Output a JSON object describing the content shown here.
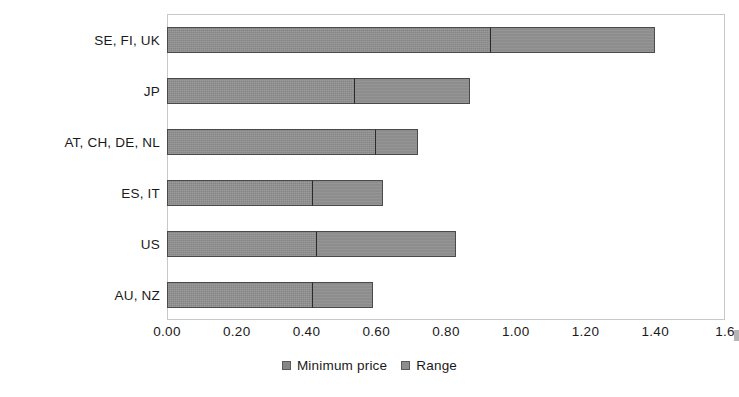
{
  "chart_data": {
    "type": "bar",
    "orientation": "horizontal",
    "stacked": true,
    "title": "",
    "subtitle": "",
    "xlabel": "",
    "ylabel": "",
    "categories": [
      "SE, FI, UK",
      "JP",
      "AT, CH, DE, NL",
      "ES, IT",
      "US",
      "AU, NZ"
    ],
    "series": [
      {
        "name": "Minimum price",
        "color": "#868686",
        "values": [
          0.93,
          0.54,
          0.6,
          0.42,
          0.43,
          0.42
        ]
      },
      {
        "name": "Range",
        "color": "#8d8d8d",
        "values": [
          0.47,
          0.33,
          0.12,
          0.2,
          0.4,
          0.17
        ]
      }
    ],
    "totals": [
      1.4,
      0.87,
      0.72,
      0.62,
      0.83,
      0.59
    ],
    "xlim": [
      0.0,
      1.6
    ],
    "xticks": [
      0.0,
      0.2,
      0.4,
      0.6,
      0.8,
      1.0,
      1.2,
      1.4,
      1.6
    ],
    "xtick_labels": [
      "0.00",
      "0.20",
      "0.40",
      "0.60",
      "0.80",
      "1.00",
      "1.20",
      "1.40",
      "1.6"
    ],
    "grid": false,
    "legend_position": "bottom-center",
    "legend": [
      "Minimum price",
      "Range"
    ]
  },
  "legend": {
    "entries": [
      {
        "label": "Minimum price",
        "color": "#868686"
      },
      {
        "label": "Range",
        "color": "#8d8d8d"
      }
    ]
  },
  "axes": {
    "category_labels": [
      "SE, FI, UK",
      "JP",
      "AT, CH, DE, NL",
      "ES, IT",
      "US",
      "AU, NZ"
    ],
    "value_tick_labels": [
      "0.00",
      "0.20",
      "0.40",
      "0.60",
      "0.80",
      "1.00",
      "1.20",
      "1.40",
      "1.6"
    ]
  }
}
